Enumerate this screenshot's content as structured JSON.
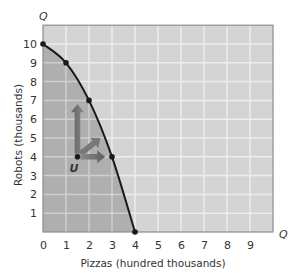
{
  "chart_data": {
    "type": "line",
    "title": "",
    "xlabel": "Pizzas (hundred thousands)",
    "ylabel": "Robots (thousands)",
    "x_axis_end_label": "Q",
    "y_axis_end_label": "Q",
    "xlim": [
      0,
      10
    ],
    "ylim": [
      0,
      11
    ],
    "x_ticks": [
      "0",
      "1",
      "2",
      "3",
      "4",
      "5",
      "6",
      "7",
      "8",
      "9"
    ],
    "y_ticks": [
      "1",
      "2",
      "3",
      "4",
      "5",
      "6",
      "7",
      "8",
      "9",
      "10"
    ],
    "grid": true,
    "series": [
      {
        "name": "Production possibilities frontier",
        "x": [
          0,
          1,
          2,
          3,
          4
        ],
        "y": [
          10,
          9,
          7,
          4,
          0
        ],
        "markers": true
      }
    ],
    "annotations": [
      {
        "label": "U",
        "x": 1.5,
        "y": 4,
        "type": "point"
      },
      {
        "type": "arrow",
        "from": [
          1.5,
          4
        ],
        "direction": "up",
        "to": [
          1.5,
          6.8
        ]
      },
      {
        "type": "arrow",
        "from": [
          1.5,
          4
        ],
        "direction": "up-right",
        "to": [
          2.5,
          5
        ]
      },
      {
        "type": "arrow",
        "from": [
          1.5,
          4
        ],
        "direction": "right",
        "to": [
          2.7,
          4
        ]
      }
    ],
    "shaded_region": "area inside frontier (attainable)",
    "colors": {
      "background": "#d4d4d4",
      "attainable_fill": "#afafaf",
      "grid_outside": "#ededed",
      "grid_inside": "#cfcfcf",
      "curve": "#1a1a1a",
      "arrow": "#6a6a6a"
    }
  }
}
